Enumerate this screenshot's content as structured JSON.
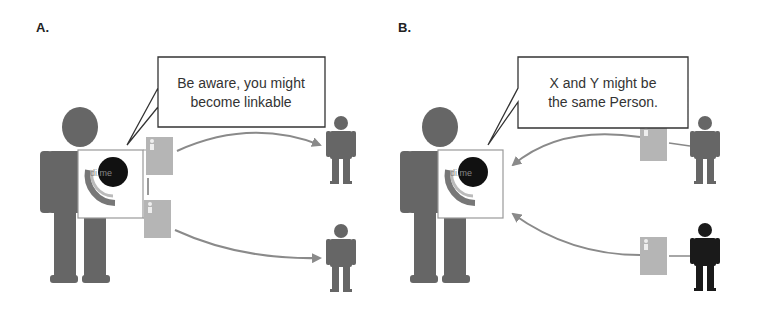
{
  "panels": [
    {
      "label": "A.",
      "bubble_line1": "Be aware, you might",
      "bubble_line2": "become linkable",
      "logo_text": "di.me",
      "description": "User with di.me device shares two profile cards with two different persons"
    },
    {
      "label": "B.",
      "bubble_line1": "X and Y might be",
      "bubble_line2": "the same Person.",
      "logo_text": "di.me",
      "description": "Two persons send profile cards to user's di.me device"
    }
  ],
  "colors": {
    "figure": "#666666",
    "card": "#b5b5b5",
    "arrow": "#8a8a8a",
    "highlight_person": "#1a1a1a",
    "logo_disc": "#111111",
    "logo_arc_outer": "#777777",
    "logo_arc_inner": "#bbbbbb"
  }
}
